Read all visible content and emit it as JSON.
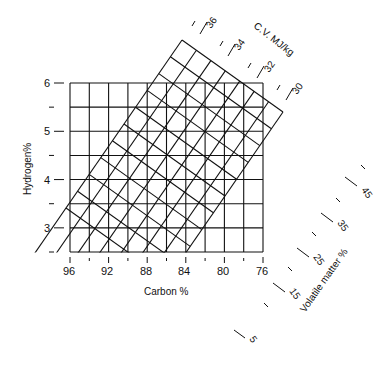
{
  "chart_data": {
    "type": "nomogram",
    "title": "",
    "xlabel": "Carbon %",
    "ylabel": "Hydrogen%",
    "x_ticks": [
      "96",
      "92",
      "88",
      "84",
      "80",
      "76"
    ],
    "x_range": [
      96,
      76
    ],
    "x_step_minor": 2,
    "y_ticks": [
      "3",
      "4",
      "5",
      "6"
    ],
    "y_range": [
      2.5,
      6
    ],
    "y_step_minor": 0.5,
    "grid": true,
    "overlay_scales": [
      {
        "name": "C.V. MJ/kg",
        "ticks": [
          "36",
          "34",
          "32",
          "30"
        ],
        "range": [
          36,
          30
        ],
        "minor_step": 1
      },
      {
        "name": "Volatile matter %",
        "ticks": [
          "5",
          "15",
          "25",
          "35",
          "45"
        ],
        "range": [
          5,
          50
        ],
        "minor_step": 5
      }
    ]
  },
  "labels": {
    "xlabel": "Carbon %",
    "ylabel": "Hydrogen%",
    "cv_title": "C.V. MJ/kg",
    "vm_title": "Volatile matter %",
    "x": [
      "96",
      "92",
      "88",
      "84",
      "80",
      "76"
    ],
    "y": [
      "6",
      "5",
      "4",
      "3"
    ],
    "cv": [
      "36",
      "34",
      "32",
      "30"
    ],
    "vm": [
      "5",
      "15",
      "25",
      "35",
      "45"
    ]
  }
}
